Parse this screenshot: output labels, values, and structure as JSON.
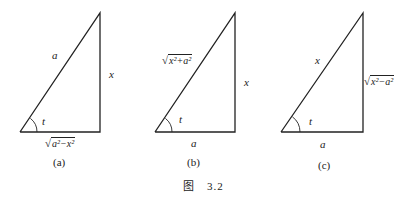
{
  "figure": {
    "caption": "图　3.2",
    "panels": [
      {
        "id": "a",
        "caption": "(a)",
        "hypotenuse": "a",
        "vertical": "x",
        "angle": "t",
        "base": {
          "radicand": "a²−x²"
        }
      },
      {
        "id": "b",
        "caption": "(b)",
        "hypotenuse": {
          "radicand": "x²+a²"
        },
        "vertical": "x",
        "angle": "t",
        "base": "a"
      },
      {
        "id": "c",
        "caption": "(c)",
        "hypotenuse": "x",
        "vertical": {
          "radicand": "x²−a²"
        },
        "angle": "t",
        "base": "a"
      }
    ]
  },
  "radical_sign": "√"
}
